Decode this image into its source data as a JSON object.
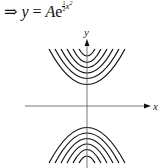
{
  "equation": {
    "arrow": "⇒",
    "lhs": "y",
    "equals": "=",
    "coef": "A",
    "base": "e",
    "exp_num": "1",
    "exp_den": "2",
    "exp_var": "x",
    "exp_pow": "2"
  },
  "figure": {
    "x_label": "x",
    "y_label": "y"
  }
}
